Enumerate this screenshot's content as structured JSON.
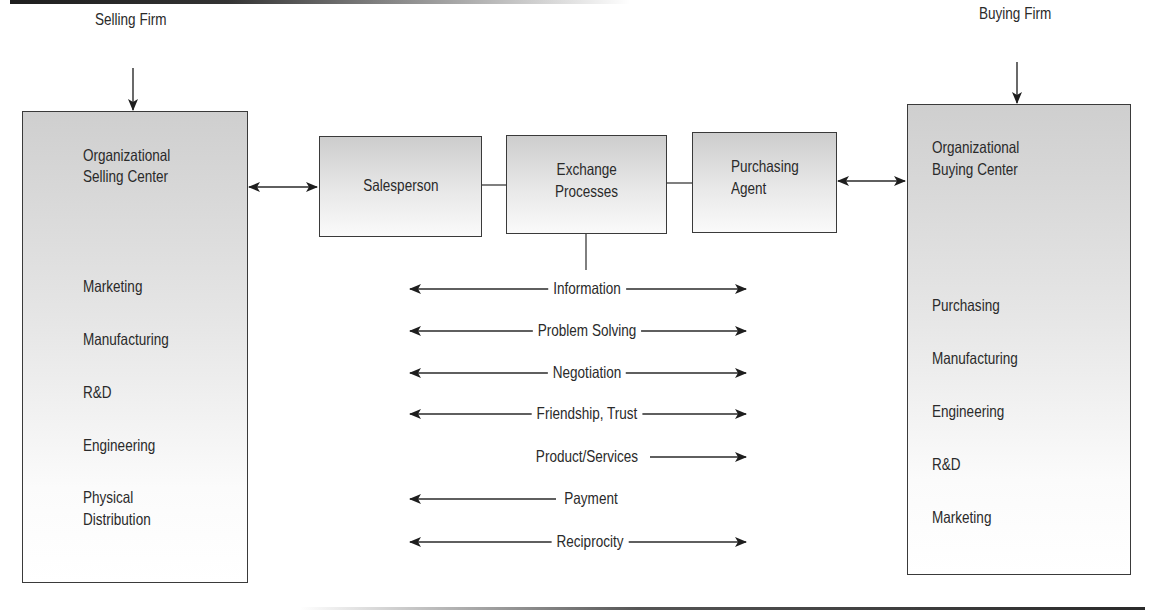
{
  "selling_firm": {
    "title": "Selling Firm",
    "center_title_line1": "Organizational",
    "center_title_line2": "Selling Center",
    "functions": [
      "Marketing",
      "Manufacturing",
      "R&D",
      "Engineering",
      "Physical",
      "Distribution"
    ]
  },
  "buying_firm": {
    "title": "Buying Firm",
    "center_title_line1": "Organizational",
    "center_title_line2": "Buying Center",
    "functions": [
      "Purchasing",
      "Manufacturing",
      "Engineering",
      "R&D",
      "Marketing"
    ]
  },
  "middle": {
    "salesperson": "Salesperson",
    "exchange_line1": "Exchange",
    "exchange_line2": "Processes",
    "agent_line1": "Purchasing",
    "agent_line2": "Agent"
  },
  "flows": [
    {
      "label": "Information",
      "direction": "both"
    },
    {
      "label": "Problem Solving",
      "direction": "both"
    },
    {
      "label": "Negotiation",
      "direction": "both"
    },
    {
      "label": "Friendship, Trust",
      "direction": "both"
    },
    {
      "label": "Product/Services",
      "direction": "right"
    },
    {
      "label": "Payment",
      "direction": "left"
    },
    {
      "label": "Reciprocity",
      "direction": "both"
    }
  ],
  "colors": {
    "line": "#2a2a2a",
    "box_top": "#cfcfcf",
    "box_bottom": "#ffffff"
  }
}
